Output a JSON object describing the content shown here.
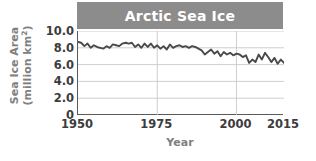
{
  "chart_data": {
    "type": "line",
    "title": "Arctic Sea Ice",
    "xlabel": "Year",
    "ylabel_line1": "Sea Ice Area",
    "ylabel_line2_prefix": "(million km",
    "ylabel_line2_sup": "2",
    "ylabel_line2_suffix": ")",
    "xlim": [
      1950,
      2015
    ],
    "ylim": [
      0,
      10
    ],
    "grid": true,
    "legend": "none",
    "y_ticks": [
      "10.0",
      "8.0",
      "6.0",
      "4.0",
      "2.0",
      "0"
    ],
    "y_tick_values": [
      10.0,
      8.0,
      6.0,
      4.0,
      2.0,
      0
    ],
    "x_ticks": [
      "1950",
      "1975",
      "2000",
      "2015"
    ],
    "x_tick_values": [
      1950,
      1975,
      2000,
      2015
    ],
    "x_gridlines": [
      1975,
      2000
    ],
    "series": [
      {
        "name": "Arctic sea ice area",
        "x": [
          1950,
          1951,
          1952,
          1953,
          1954,
          1955,
          1956,
          1957,
          1958,
          1959,
          1960,
          1961,
          1962,
          1963,
          1964,
          1965,
          1966,
          1967,
          1968,
          1969,
          1970,
          1971,
          1972,
          1973,
          1974,
          1975,
          1976,
          1977,
          1978,
          1979,
          1980,
          1981,
          1982,
          1983,
          1984,
          1985,
          1986,
          1987,
          1988,
          1989,
          1990,
          1991,
          1992,
          1993,
          1994,
          1995,
          1996,
          1997,
          1998,
          1999,
          2000,
          2001,
          2002,
          2003,
          2004,
          2005,
          2006,
          2007,
          2008,
          2009,
          2010,
          2011,
          2012,
          2013,
          2014,
          2015
        ],
        "values": [
          8.7,
          8.6,
          8.2,
          8.5,
          8.0,
          8.3,
          8.1,
          8.0,
          7.9,
          8.2,
          8.0,
          8.4,
          8.3,
          8.2,
          8.5,
          8.6,
          8.5,
          8.6,
          8.1,
          8.4,
          8.0,
          8.5,
          8.1,
          8.5,
          8.0,
          8.3,
          7.9,
          8.2,
          7.8,
          8.4,
          8.0,
          8.2,
          8.3,
          8.1,
          8.2,
          8.0,
          8.2,
          8.1,
          7.9,
          7.7,
          7.2,
          7.5,
          7.8,
          7.3,
          7.6,
          7.0,
          7.5,
          7.2,
          7.4,
          7.1,
          7.3,
          7.2,
          6.9,
          7.1,
          6.2,
          6.6,
          6.3,
          7.2,
          6.6,
          7.4,
          6.9,
          6.3,
          6.8,
          6.1,
          6.6,
          6.2
        ]
      }
    ]
  },
  "annotations": {
    "title_banner_color": "#8c8c8c",
    "title_text_color": "#ffffff",
    "line_color": "#4a4a4a",
    "grid_color": "#c8c8c8",
    "axis_color": "#5a5a5a",
    "tick_label_color": "#3c3c3c",
    "axis_title_color": "#808080"
  }
}
